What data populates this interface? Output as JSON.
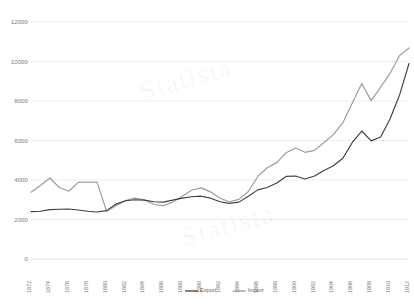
{
  "chart_data": {
    "type": "line",
    "title": "",
    "subtitle": "",
    "xlabel": "",
    "ylabel": "",
    "ylim": [
      0,
      12000
    ],
    "yticks": [
      0,
      2000,
      4000,
      6000,
      8000,
      10000,
      12000
    ],
    "ytick_labels": [
      "0",
      "2000",
      "4000",
      "6000",
      "8000",
      "10000",
      "12000"
    ],
    "grid": true,
    "legend_position": "bottom",
    "x": [
      1872,
      1873,
      1874,
      1875,
      1876,
      1877,
      1878,
      1879,
      1880,
      1881,
      1882,
      1883,
      1884,
      1885,
      1886,
      1887,
      1888,
      1889,
      1890,
      1891,
      1892,
      1893,
      1894,
      1895,
      1896,
      1897,
      1898,
      1899,
      1900,
      1901,
      1902,
      1903,
      1904,
      1905,
      1906,
      1907,
      1908,
      1909,
      1910,
      1911,
      1912
    ],
    "xtick_labels": [
      "1872",
      "1874",
      "1876",
      "1878",
      "1880",
      "1882",
      "1884",
      "1886",
      "1888",
      "1890",
      "1892",
      "1894",
      "1896",
      "1898",
      "1900",
      "1902",
      "1904",
      "1906",
      "1908",
      "1910",
      "1912"
    ],
    "series": [
      {
        "name": "Export",
        "color": "#3f3f3f",
        "values": [
          2400,
          2420,
          2500,
          2520,
          2530,
          2480,
          2420,
          2380,
          2450,
          2780,
          2950,
          3000,
          2980,
          2900,
          2880,
          2980,
          3080,
          3150,
          3180,
          3080,
          2900,
          2820,
          2880,
          3180,
          3500,
          3620,
          3850,
          4180,
          4200,
          4050,
          4200,
          4480,
          4720,
          5100,
          5900,
          6480,
          5980,
          6180,
          7100,
          8300,
          9900
        ]
      },
      {
        "name": "Import",
        "color": "#9b9b9b",
        "values": [
          3380,
          3720,
          4100,
          3620,
          3430,
          3880,
          3900,
          3880,
          2420,
          2700,
          2960,
          3080,
          3000,
          2760,
          2700,
          2880,
          3180,
          3480,
          3600,
          3400,
          3080,
          2900,
          3020,
          3420,
          4180,
          4620,
          4880,
          5380,
          5620,
          5400,
          5500,
          5900,
          6300,
          6900,
          7900,
          8880,
          8020,
          8700,
          9400,
          10300,
          10680
        ]
      }
    ]
  },
  "legend": {
    "entries": [
      {
        "label": "Export"
      },
      {
        "label": "Import"
      }
    ]
  },
  "watermark": {
    "lines": [
      "Statista",
      "Statista"
    ]
  },
  "colors": {
    "export": "#3f3f3f",
    "import": "#9b9b9b",
    "grid": "#e8e8e8",
    "text": "#7d7d7d",
    "background": "#ffffff"
  }
}
